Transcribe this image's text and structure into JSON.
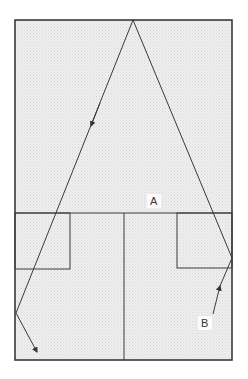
{
  "diagram": {
    "type": "room-plan-ray-reflection",
    "colors": {
      "background": "#ffffff",
      "fill": "#ebebeb",
      "stroke": "#3a3a3a",
      "label_bg": "#ffffff"
    },
    "labels": {
      "a": "A",
      "b": "B"
    },
    "outer_rect": {
      "x": 15,
      "y": 20,
      "w": 217,
      "h": 340
    },
    "divider_y": 213,
    "center_line_x": 124,
    "left_box": {
      "x": 15,
      "y": 213,
      "w": 55,
      "h": 56
    },
    "right_box": {
      "x": 177,
      "y": 213,
      "w": 55,
      "h": 55
    },
    "ray_left": {
      "points": [
        [
          133,
          20
        ],
        [
          16,
          313
        ],
        [
          37,
          352
        ]
      ],
      "mid_arrow": [
        91,
        128
      ]
    },
    "ray_right": {
      "points": [
        [
          133,
          20
        ],
        [
          232,
          258
        ]
      ]
    },
    "ray_b": {
      "points": [
        [
          213,
          314
        ],
        [
          232,
          258
        ]
      ],
      "arrow_at": [
        220,
        287
      ]
    },
    "label_positions": {
      "a": [
        154,
        205
      ],
      "b": [
        205,
        327
      ]
    }
  }
}
